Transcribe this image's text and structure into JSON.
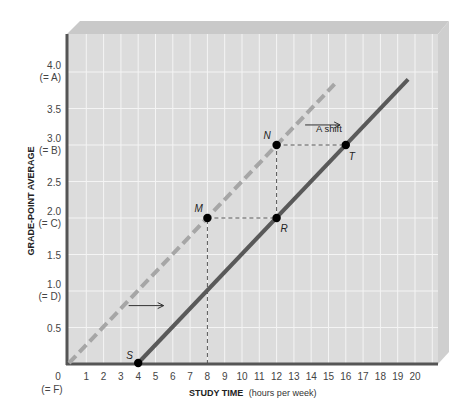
{
  "chart_data": {
    "type": "line",
    "title": "",
    "xlabel": "STUDY TIME",
    "xlabel_unit": "(hours per week)",
    "ylabel": "GRADE-POINT AVERAGE",
    "xlim": [
      0,
      20
    ],
    "ylim": [
      0,
      4
    ],
    "grid": true,
    "x_ticks": [
      "1",
      "2",
      "3",
      "4",
      "5",
      "6",
      "7",
      "8",
      "9",
      "10",
      "11",
      "12",
      "13",
      "14",
      "15",
      "16",
      "17",
      "18",
      "19",
      "20"
    ],
    "x_origin_label": "0",
    "x_origin_sublabel": "(= F)",
    "y_ticks": [
      {
        "value": 0.5,
        "label": "0.5",
        "sublabel": ""
      },
      {
        "value": 1.0,
        "label": "1.0",
        "sublabel": "(= D)"
      },
      {
        "value": 1.5,
        "label": "1.5",
        "sublabel": ""
      },
      {
        "value": 2.0,
        "label": "2.0",
        "sublabel": "(= C)"
      },
      {
        "value": 2.5,
        "label": "2.5",
        "sublabel": ""
      },
      {
        "value": 3.0,
        "label": "3.0",
        "sublabel": "(= B)"
      },
      {
        "value": 3.5,
        "label": "3.5",
        "sublabel": ""
      },
      {
        "value": 4.0,
        "label": "4.0",
        "sublabel": "(= A)"
      }
    ],
    "series": [
      {
        "name": "original",
        "style": "dashed",
        "color": "#a6a6a6",
        "x": [
          0,
          15.5
        ],
        "y": [
          0,
          3.87
        ]
      },
      {
        "name": "shifted",
        "style": "solid",
        "color": "#595959",
        "x": [
          4,
          19.6
        ],
        "y": [
          0,
          3.9
        ]
      }
    ],
    "points": [
      {
        "label": "S",
        "x": 4,
        "y": 0
      },
      {
        "label": "M",
        "x": 8,
        "y": 2.0
      },
      {
        "label": "R",
        "x": 12,
        "y": 2.0
      },
      {
        "label": "N",
        "x": 12,
        "y": 3.0
      },
      {
        "label": "T",
        "x": 16,
        "y": 3.0
      }
    ],
    "guides": [
      {
        "from": [
          8,
          0
        ],
        "to": [
          8,
          2.0
        ]
      },
      {
        "from": [
          8,
          2.0
        ],
        "to": [
          12,
          2.0
        ]
      },
      {
        "from": [
          12,
          2.0
        ],
        "to": [
          12,
          3.0
        ]
      },
      {
        "from": [
          12,
          3.0
        ],
        "to": [
          16,
          3.0
        ]
      }
    ],
    "annotations": [
      {
        "text": "A shift",
        "x": 14.4,
        "y": 3.22,
        "arrow": true
      },
      {
        "text": "",
        "x": 4.2,
        "y": 0.8,
        "arrow": true
      }
    ]
  },
  "labels": {
    "y_axis_title": "GRADE-POINT AVERAGE",
    "x_axis_title": "STUDY TIME",
    "x_axis_unit": "(hours per week)",
    "origin": "0",
    "origin_sub": "(= F)",
    "shift_note": "A shift",
    "point_S": "S",
    "point_M": "M",
    "point_R": "R",
    "point_N": "N",
    "point_T": "T"
  },
  "colors": {
    "plot_bg": "#dcdcdc",
    "grid": "#f4f4f4",
    "bevel_top": "#c9c9c9",
    "bevel_side": "#cfcfcf",
    "axis": "#555555",
    "dashed_line": "#a6a6a6",
    "solid_line": "#595959",
    "point": "#000000"
  }
}
